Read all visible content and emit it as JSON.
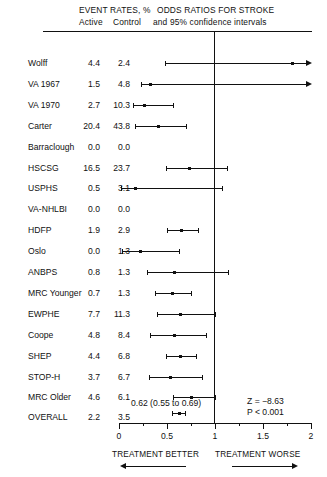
{
  "header": {
    "event_rates": "EVENT RATES, %",
    "active": "Active",
    "control": "Control",
    "odds_ratios": "ODDS RATIOS FOR STROKE",
    "confidence": "and 95% confidence intervals"
  },
  "axis": {
    "tick_labels": [
      "0",
      "0.5",
      "1",
      "1.5",
      "2"
    ],
    "tick_values": [
      0,
      0.5,
      1,
      1.5,
      2
    ],
    "minor_ticks": [
      0.25,
      0.75,
      1.25,
      1.75
    ],
    "min": 0,
    "max": 2,
    "null_value": 1
  },
  "annotations": {
    "overall_ci_text": "0.62 (0.55 to 0.69)",
    "z_statistic": "Z = −8.63",
    "p_value": "P < 0.001",
    "treatment_better": "TREATMENT BETTER",
    "treatment_worse": "TREATMENT WORSE"
  },
  "chart_data": {
    "type": "forest",
    "title": "ODDS RATIOS FOR STROKE",
    "subtitle": "and 95% confidence intervals",
    "xlabel": "Odds ratio",
    "xlim": [
      0,
      2
    ],
    "null_line": 1,
    "grid": false,
    "legend": "none",
    "columns": [
      "Study",
      "Active",
      "Control",
      "Odds ratio",
      "95% CI low",
      "95% CI high"
    ],
    "rows": [
      {
        "study": "Wolff",
        "active": "4.4",
        "control": "2.4",
        "or": 1.8,
        "lo": 0.48,
        "hi": 2.05,
        "arrow_right": true,
        "no_ci": false
      },
      {
        "study": "VA 1967",
        "active": "1.5",
        "control": "4.8",
        "or": 0.32,
        "lo": 0.23,
        "hi": 2.05,
        "arrow_right": true,
        "no_ci": false
      },
      {
        "study": "VA 1970",
        "active": "2.7",
        "control": "10.3",
        "or": 0.26,
        "lo": 0.15,
        "hi": 0.56,
        "arrow_right": false,
        "no_ci": false
      },
      {
        "study": "Carter",
        "active": "20.4",
        "control": "43.8",
        "or": 0.41,
        "lo": 0.17,
        "hi": 0.7,
        "arrow_right": false,
        "no_ci": false
      },
      {
        "study": "Barraclough",
        "active": "0.0",
        "control": "0.0",
        "or": null,
        "lo": null,
        "hi": null,
        "arrow_right": false,
        "no_ci": true
      },
      {
        "study": "HSCSG",
        "active": "16.5",
        "control": "23.7",
        "or": 0.73,
        "lo": 0.49,
        "hi": 1.13,
        "arrow_right": false,
        "no_ci": false
      },
      {
        "study": "USPHS",
        "active": "0.5",
        "control": "3.1",
        "or": 0.17,
        "lo": 0.02,
        "hi": 1.07,
        "arrow_right": false,
        "no_ci": false
      },
      {
        "study": "VA-NHLBI",
        "active": "0.0",
        "control": "0.0",
        "or": null,
        "lo": null,
        "hi": null,
        "arrow_right": false,
        "no_ci": true
      },
      {
        "study": "HDFP",
        "active": "1.9",
        "control": "2.9",
        "or": 0.65,
        "lo": 0.5,
        "hi": 0.82,
        "arrow_right": false,
        "no_ci": false
      },
      {
        "study": "Oslo",
        "active": "0.0",
        "control": "1.3",
        "or": 0.22,
        "lo": 0.03,
        "hi": 0.62,
        "arrow_right": false,
        "no_ci": false
      },
      {
        "study": "ANBPS",
        "active": "0.8",
        "control": "1.3",
        "or": 0.57,
        "lo": 0.29,
        "hi": 1.14,
        "arrow_right": false,
        "no_ci": false
      },
      {
        "study": "MRC Younger",
        "active": "0.7",
        "control": "1.3",
        "or": 0.55,
        "lo": 0.37,
        "hi": 0.75,
        "arrow_right": false,
        "no_ci": false
      },
      {
        "study": "EWPHE",
        "active": "7.7",
        "control": "11.3",
        "or": 0.64,
        "lo": 0.4,
        "hi": 1.0,
        "arrow_right": false,
        "no_ci": false
      },
      {
        "study": "Coope",
        "active": "4.8",
        "control": "8.4",
        "or": 0.57,
        "lo": 0.32,
        "hi": 0.91,
        "arrow_right": false,
        "no_ci": false
      },
      {
        "study": "SHEP",
        "active": "4.4",
        "control": "6.8",
        "or": 0.64,
        "lo": 0.49,
        "hi": 0.8,
        "arrow_right": false,
        "no_ci": false
      },
      {
        "study": "STOP-H",
        "active": "3.7",
        "control": "6.7",
        "or": 0.53,
        "lo": 0.31,
        "hi": 0.86,
        "arrow_right": false,
        "no_ci": false
      },
      {
        "study": "MRC Older",
        "active": "4.6",
        "control": "6.1",
        "or": 0.75,
        "lo": 0.56,
        "hi": 1.0,
        "arrow_right": false,
        "no_ci": false
      }
    ],
    "overall": {
      "study": "OVERALL",
      "active": "2.2",
      "control": "3.5",
      "or": 0.62,
      "lo": 0.55,
      "hi": 0.69,
      "label": "0.62 (0.55 to 0.69)",
      "z": "Z = −8.63",
      "p": "P < 0.001"
    }
  }
}
